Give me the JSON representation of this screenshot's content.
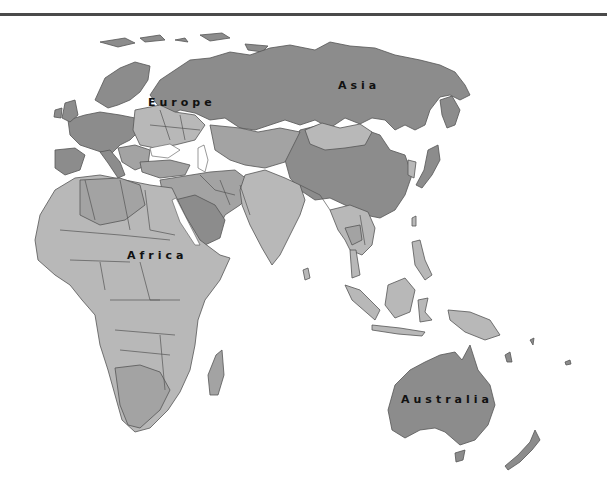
{
  "map": {
    "title": "",
    "labels": {
      "europe": "Europe",
      "asia": "Asia",
      "africa": "Africa",
      "australia": "Australia"
    },
    "colors": {
      "background": "#ffffff",
      "rule": "#4a4a4a",
      "dark_region": "#8c8c8c",
      "mid_region": "#a3a3a3",
      "light_region": "#b8b8b8",
      "border": "#555555",
      "label_text": "#111111"
    }
  }
}
